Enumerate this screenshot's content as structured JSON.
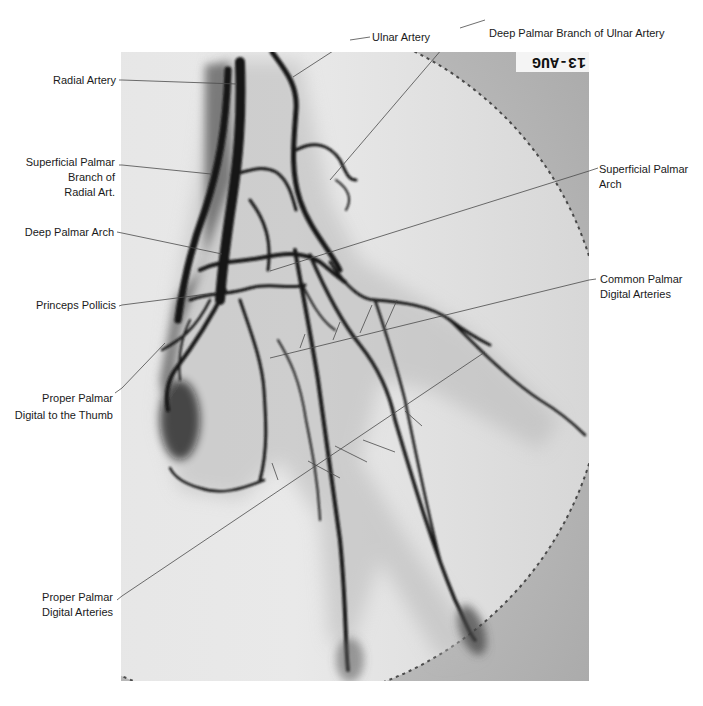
{
  "figure": {
    "type": "angiogram",
    "film_marker": "13-AUG",
    "colors": {
      "background": "#ffffff",
      "film_light": "#e6e6e6",
      "film_dark": "#b9b9b9",
      "vessel": "#141414",
      "leader_line": "#4a4a4a",
      "label_text": "#1a1a1a"
    }
  },
  "labels": {
    "radial_artery": {
      "lines": [
        "Radial Artery"
      ]
    },
    "superficial_palmar_branch": {
      "lines": [
        "Superficial Palmar",
        "Branch of",
        "Radial Art."
      ]
    },
    "deep_palmar_arch": {
      "lines": [
        "Deep Palmar Arch"
      ]
    },
    "princeps_pollicis": {
      "lines": [
        "Princeps Pollicis"
      ]
    },
    "proper_palmar_thumb": {
      "lines": [
        "Proper Palmar",
        "Digital to the Thumb"
      ]
    },
    "proper_palmar_digital": {
      "lines": [
        "Proper Palmar",
        "Digital Arteries"
      ]
    },
    "ulnar_artery": {
      "lines": [
        "Ulnar Artery"
      ]
    },
    "deep_palmar_branch_ulnar": {
      "lines": [
        "Deep Palmar Branch of Ulnar Artery"
      ]
    },
    "superficial_palmar_arch": {
      "lines": [
        "Superficial Palmar",
        "Arch"
      ]
    },
    "common_palmar_digital": {
      "lines": [
        "Common Palmar",
        "Digital Arteries"
      ]
    }
  }
}
